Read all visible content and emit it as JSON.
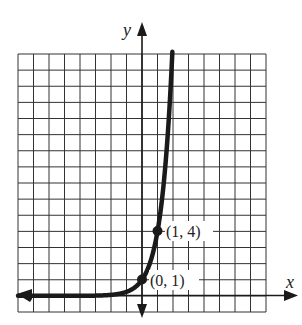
{
  "chart_data": {
    "type": "line",
    "title": "",
    "xlabel": "x",
    "ylabel": "y",
    "function": "y = 4^x",
    "grid": true,
    "grid_columns": 16,
    "grid_rows": 16,
    "xlim": [
      -8,
      8
    ],
    "ylim": [
      -1,
      15
    ],
    "labeled_points": [
      {
        "x": 0,
        "y": 1,
        "label": "(0, 1)"
      },
      {
        "x": 1,
        "y": 4,
        "label": "(1, 4)"
      }
    ],
    "series": [
      {
        "name": "exponential curve",
        "x": [
          -8,
          -3,
          -2,
          -1,
          -0.5,
          0,
          0.5,
          1,
          1.5,
          1.95
        ],
        "y": [
          0,
          0.016,
          0.0625,
          0.25,
          0.5,
          1,
          2,
          4,
          8,
          15
        ]
      }
    ],
    "colors": {
      "curve": "#1a1a1a",
      "grid": "#2a2a2a",
      "axis": "#1a1a1a"
    }
  },
  "labels": {
    "x_axis": "x",
    "y_axis": "y",
    "point_a": "(0, 1)",
    "point_b": "(1, 4)"
  }
}
